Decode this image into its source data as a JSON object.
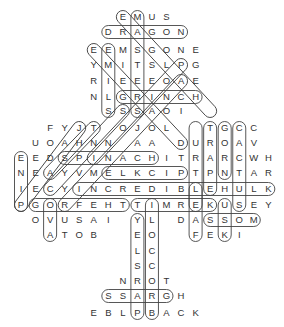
{
  "puzzle": {
    "type": "word-search",
    "shape": "tree",
    "grid_origin": {
      "x": 21,
      "col_step": 14.55
    },
    "row_y": [
      17,
      32,
      50,
      65,
      81,
      97,
      111,
      128,
      143,
      158,
      173,
      189,
      205,
      220,
      235,
      251,
      266,
      281,
      296,
      313
    ],
    "rows": [
      {
        "start": 7,
        "letters": "EMUS"
      },
      {
        "start": 6,
        "letters": "DRAGON"
      },
      {
        "start": 5,
        "letters": "EEMSGONE"
      },
      {
        "start": 5,
        "letters": "YMITSLPG"
      },
      {
        "start": 5,
        "letters": "RIEEEOAE"
      },
      {
        "start": 5,
        "letters": "NLGRINCH"
      },
      {
        "start": 6,
        "letters": "SSSAOI"
      },
      {
        "start": 2,
        "letters": "FYJT OJOL  TGCC"
      },
      {
        "start": 1,
        "letters": "UOAHNN AA DUROAV"
      },
      {
        "start": 0,
        "letters": "EEDSPINACHITRARCWH"
      },
      {
        "start": 0,
        "letters": "NEAYVMELKCIPTPNTAR"
      },
      {
        "start": 0,
        "letters": "IECYINCREDIBLEHULK"
      },
      {
        "start": 0,
        "letters": "PGORFEHTTIMREKUSEY"
      },
      {
        "start": 1,
        "letters": "OVUSAI YL DASSOM"
      },
      {
        "start": 2,
        "letters": "ATOB  EO  FEKI"
      },
      {
        "start": 8,
        "letters": "LC"
      },
      {
        "start": 8,
        "letters": "SC"
      },
      {
        "start": 7,
        "letters": "NROT"
      },
      {
        "start": 6,
        "letters": "SSARGH"
      },
      {
        "start": 5,
        "letters": "EBLPBACK"
      }
    ],
    "found_words": [
      {
        "word": "DRAGON",
        "dir": "h",
        "row": 1,
        "c0": 6,
        "c1": 11
      },
      {
        "word": "GRINCH",
        "dir": "h",
        "row": 5,
        "c0": 7,
        "c1": 12
      },
      {
        "word": "SPINACH",
        "dir": "h",
        "row": 9,
        "c0": 3,
        "c1": 9
      },
      {
        "word": "PICKLE",
        "dir": "h",
        "row": 10,
        "c0": 6,
        "c1": 11
      },
      {
        "word": "INCREDIBLE HULK",
        "dir": "h",
        "row": 11,
        "c0": 4,
        "c1": 17
      },
      {
        "word": "THE FROG",
        "dir": "h",
        "row": 12,
        "c0": 1,
        "c1": 7
      },
      {
        "word": "KERMIT",
        "dir": "h",
        "row": 12,
        "c0": 8,
        "c1": 13
      },
      {
        "word": "MOSS",
        "dir": "h",
        "row": 13,
        "c0": 13,
        "c1": 16
      },
      {
        "word": "GRASS",
        "dir": "h",
        "row": 18,
        "c0": 6,
        "c1": 10
      },
      {
        "word": "PINE",
        "dir": "v",
        "col": 0,
        "r0": 9,
        "r1": 12
      },
      {
        "word": "SLIME",
        "dir": "v",
        "col": 6,
        "r0": 2,
        "r1": 6
      },
      {
        "word": "MASTERS",
        "dir": "v",
        "col": 8,
        "r0": 0,
        "r1": 6
      },
      {
        "word": "TURTLE",
        "dir": "v",
        "col": 12,
        "r0": 7,
        "r1": 12
      },
      {
        "word": "GRAPE",
        "dir": "v",
        "col": 13,
        "r0": 7,
        "r1": 11
      },
      {
        "word": "CORN",
        "dir": "v",
        "col": 14,
        "r0": 7,
        "r1": 10
      },
      {
        "word": "CACTUS",
        "dir": "v",
        "col": 15,
        "r0": 7,
        "r1": 12
      },
      {
        "word": "OVA",
        "dir": "v",
        "col": 2,
        "r0": 12,
        "r1": 14
      },
      {
        "word": "PARSLEY",
        "dir": "v",
        "col": 8,
        "r0": 13,
        "r1": 19
      },
      {
        "word": "BROCCOLI",
        "dir": "v",
        "col": 9,
        "r0": 12,
        "r1": 19
      },
      {
        "word": "LEAF",
        "dir": "v",
        "col": 12,
        "r0": 11,
        "r1": 14
      },
      {
        "word": "KIWI",
        "dir": "v",
        "col": 14,
        "r0": 12,
        "r1": 14
      }
    ],
    "diagonals": [
      {
        "r0": 0,
        "c0": 7,
        "r1": 6,
        "c1": 13
      },
      {
        "r0": 2,
        "c0": 5,
        "r1": 8,
        "c1": 11
      },
      {
        "r0": 3,
        "c0": 11,
        "r1": 9,
        "c1": 5
      },
      {
        "r0": 4,
        "c0": 11,
        "r1": 12,
        "c1": 3
      },
      {
        "r0": 7,
        "c0": 4,
        "r1": 12,
        "c1": 0
      },
      {
        "r0": 7,
        "c0": 5,
        "r1": 10,
        "c1": 2
      },
      {
        "r0": 6,
        "c0": 7,
        "r1": 11,
        "c1": 2
      }
    ]
  }
}
